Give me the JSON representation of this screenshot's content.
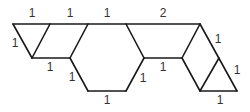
{
  "diagram": {
    "title": "",
    "labels": {
      "top_left": "1",
      "top_middle_left": "1",
      "top_middle": "1",
      "top_right": "2",
      "left_triangle_side": "1",
      "left_mid_segment": "1",
      "hex_lower_left": "1",
      "hex_bottom": "1",
      "right_mid_segment": "1",
      "hex_lower_right": "1",
      "right_upper_side": "1",
      "right_triangle_side": "1",
      "right_bottom": "1"
    }
  }
}
